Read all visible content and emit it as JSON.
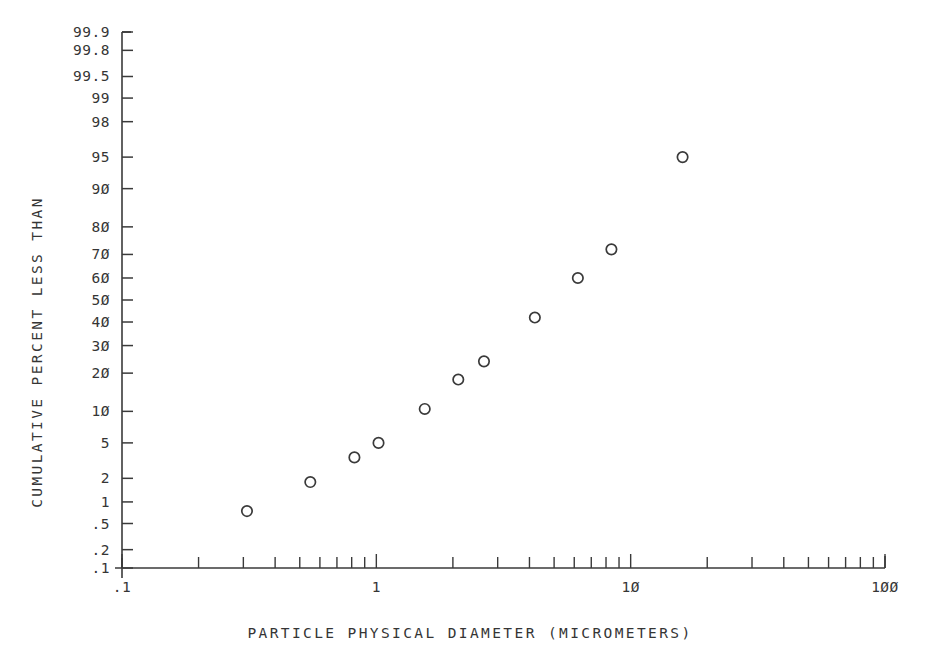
{
  "chart_data": {
    "type": "scatter",
    "title": "",
    "xlabel": "PARTICLE PHYSICAL DIAMETER (MICROMETERS)",
    "ylabel": "CUMULATIVE PERCENT LESS THAN",
    "xscale": "log",
    "yscale": "probability",
    "xlim": [
      0.1,
      100
    ],
    "ylim": [
      0.1,
      99.9
    ],
    "grid": false,
    "legend": null,
    "marker": "open-circle",
    "x": [
      0.31,
      0.55,
      0.82,
      1.02,
      1.55,
      2.1,
      2.65,
      4.2,
      6.2,
      8.4,
      16.0
    ],
    "y": [
      0.75,
      1.8,
      3.5,
      5.0,
      10.5,
      18.0,
      24.0,
      42.0,
      60.0,
      72.0,
      95.0
    ],
    "points": [
      {
        "x": 0.31,
        "y": 0.75
      },
      {
        "x": 0.55,
        "y": 1.8
      },
      {
        "x": 0.82,
        "y": 3.5
      },
      {
        "x": 1.02,
        "y": 5.0
      },
      {
        "x": 1.55,
        "y": 10.5
      },
      {
        "x": 2.1,
        "y": 18.0
      },
      {
        "x": 2.65,
        "y": 24.0
      },
      {
        "x": 4.2,
        "y": 42.0
      },
      {
        "x": 6.2,
        "y": 60.0
      },
      {
        "x": 8.4,
        "y": 72.0
      },
      {
        "x": 16.0,
        "y": 95.0
      }
    ],
    "xtick_labels": [
      ".1",
      "1",
      "1Ø",
      "1ØØ"
    ],
    "xtick_values": [
      0.1,
      1,
      10,
      100
    ],
    "ytick_labels": [
      "99.9",
      "99.8",
      "99.5",
      "99",
      "98",
      "95",
      "9Ø",
      "8Ø",
      "7Ø",
      "6Ø",
      "5Ø",
      "4Ø",
      "3Ø",
      "2Ø",
      "1Ø",
      "5",
      "2",
      "1",
      ".5",
      ".2",
      ".1"
    ],
    "ytick_values": [
      99.9,
      99.8,
      99.5,
      99,
      98,
      95,
      90,
      80,
      70,
      60,
      50,
      40,
      30,
      20,
      10,
      5,
      2,
      1,
      0.5,
      0.2,
      0.1
    ]
  },
  "axes": {
    "y_title": "CUMULATIVE PERCENT LESS THAN",
    "x_title": "PARTICLE PHYSICAL DIAMETER (MICROMETERS)"
  },
  "colors": {
    "ink": "#2b2b2b",
    "axis": "#3a3a3a",
    "marker": "#3a3a3a",
    "background": "#ffffff"
  },
  "header": {
    "ghost_text": ""
  }
}
